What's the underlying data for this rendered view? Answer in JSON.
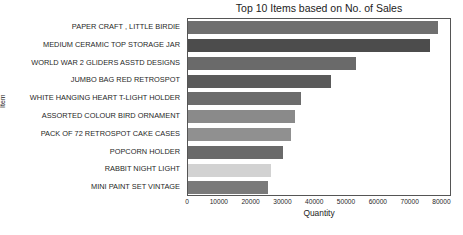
{
  "chart_data": {
    "type": "bar",
    "orientation": "horizontal",
    "title": "Top 10 Items based on No. of Sales",
    "xlabel": "Quantity",
    "ylabel": "Item",
    "categories": [
      "PAPER CRAFT , LITTLE BIRDIE",
      "MEDIUM CERAMIC TOP STORAGE JAR",
      "WORLD WAR 2 GLIDERS ASSTD DESIGNS",
      "JUMBO BAG RED RETROSPOT",
      "WHITE HANGING HEART T-LIGHT HOLDER",
      "ASSORTED COLOUR BIRD ORNAMENT",
      "PACK OF 72 RETROSPOT CAKE CASES",
      "POPCORN HOLDER",
      "RABBIT NIGHT LIGHT",
      "MINI PAINT SET VINTAGE"
    ],
    "values": [
      78700,
      76200,
      52700,
      45100,
      35400,
      33500,
      32300,
      29800,
      26000,
      25100
    ],
    "bar_colors": [
      "#6f6f6f",
      "#4c4c4c",
      "#6a6a6a",
      "#5a5a5a",
      "#6c6c6c",
      "#8a8a8a",
      "#909090",
      "#6a6a6a",
      "#d2d2d2",
      "#7a7a7a"
    ],
    "xlim": [
      0,
      83000
    ],
    "xticks": [
      0,
      10000,
      20000,
      30000,
      40000,
      50000,
      60000,
      70000,
      80000
    ],
    "xtick_labels": [
      "0",
      "10000",
      "20000",
      "30000",
      "40000",
      "50000",
      "60000",
      "70000",
      "80000"
    ],
    "grid": false,
    "legend": false
  }
}
